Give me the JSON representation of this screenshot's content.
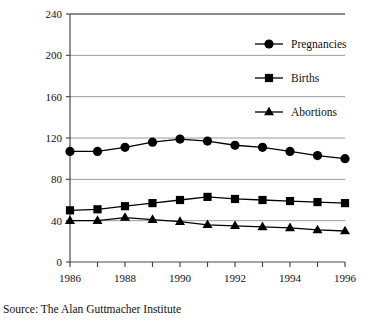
{
  "chart_data": {
    "type": "line",
    "title": "",
    "xlabel": "",
    "ylabel": "Rate per 1,000 women 15–19",
    "x": [
      1986,
      1987,
      1988,
      1989,
      1990,
      1991,
      1992,
      1993,
      1994,
      1995,
      1996
    ],
    "xtick_labels": [
      "1986",
      "1988",
      "1990",
      "1992",
      "1994",
      "1996"
    ],
    "xtick_values": [
      1986,
      1988,
      1990,
      1992,
      1994,
      1996
    ],
    "xlim": [
      1986,
      1996
    ],
    "ytick_labels": [
      "0",
      "40",
      "80",
      "120",
      "160",
      "200",
      "240"
    ],
    "ytick_values": [
      0,
      40,
      80,
      120,
      160,
      200,
      240
    ],
    "ylim": [
      0,
      240
    ],
    "grid": "horizontal",
    "legend_position": "upper right inside",
    "series": [
      {
        "name": "Pregnancies",
        "marker": "circle",
        "color": "#000000",
        "values": [
          107,
          107,
          111,
          116,
          119,
          117,
          113,
          111,
          107,
          103,
          100
        ]
      },
      {
        "name": "Births",
        "marker": "square",
        "color": "#000000",
        "values": [
          50,
          51,
          54,
          57,
          60,
          63,
          61,
          60,
          59,
          58,
          57
        ]
      },
      {
        "name": "Abortions",
        "marker": "triangle",
        "color": "#000000",
        "values": [
          40,
          40,
          43,
          41,
          39,
          36,
          35,
          34,
          33,
          31,
          30
        ]
      }
    ],
    "source": "Source: The Alan Guttmacher Institute"
  },
  "legend": {
    "items": [
      {
        "label": "Pregnancies",
        "marker": "circle"
      },
      {
        "label": "Births",
        "marker": "square"
      },
      {
        "label": "Abortions",
        "marker": "triangle"
      }
    ]
  },
  "footer": {
    "source": "Source: The Alan Guttmacher Institute"
  },
  "axes": {
    "y_axis_title": "Rate per 1,000 women 15–19"
  },
  "colors": {
    "series": "#000000",
    "gridline": "#9a9a9a",
    "axis": "#4a4a4a",
    "background": "#ffffff",
    "text": "#111111"
  }
}
